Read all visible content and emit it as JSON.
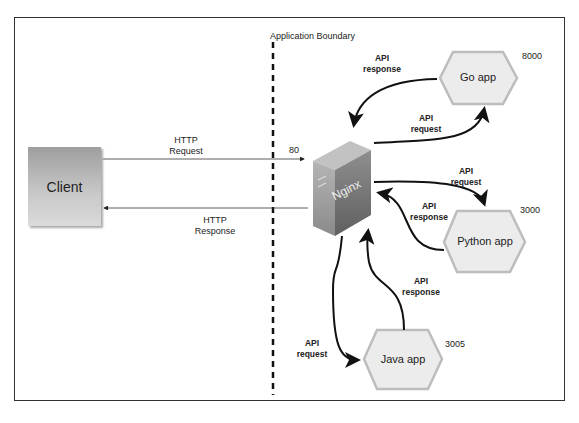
{
  "boundary": {
    "label": "Application Boundary"
  },
  "client": {
    "label": "Client"
  },
  "nginx": {
    "label": "Nginx",
    "port": "80"
  },
  "http": {
    "request": [
      "HTTP",
      "Request"
    ],
    "response": [
      "HTTP",
      "Response"
    ]
  },
  "services": [
    {
      "name": "Go app",
      "port": "8000",
      "request_label": [
        "API",
        "request"
      ],
      "response_label": [
        "API",
        "response"
      ]
    },
    {
      "name": "Python app",
      "port": "3000",
      "request_label": [
        "API",
        "request"
      ],
      "response_label": [
        "API",
        "response"
      ]
    },
    {
      "name": "Java app",
      "port": "3005",
      "request_label": [
        "API",
        "request"
      ],
      "response_label": [
        "API",
        "response"
      ]
    }
  ],
  "colors": {
    "hex_fill": "#ececec",
    "hex_stroke": "#bdbdbd",
    "server": "#8a8a8a",
    "line": "#111111"
  }
}
